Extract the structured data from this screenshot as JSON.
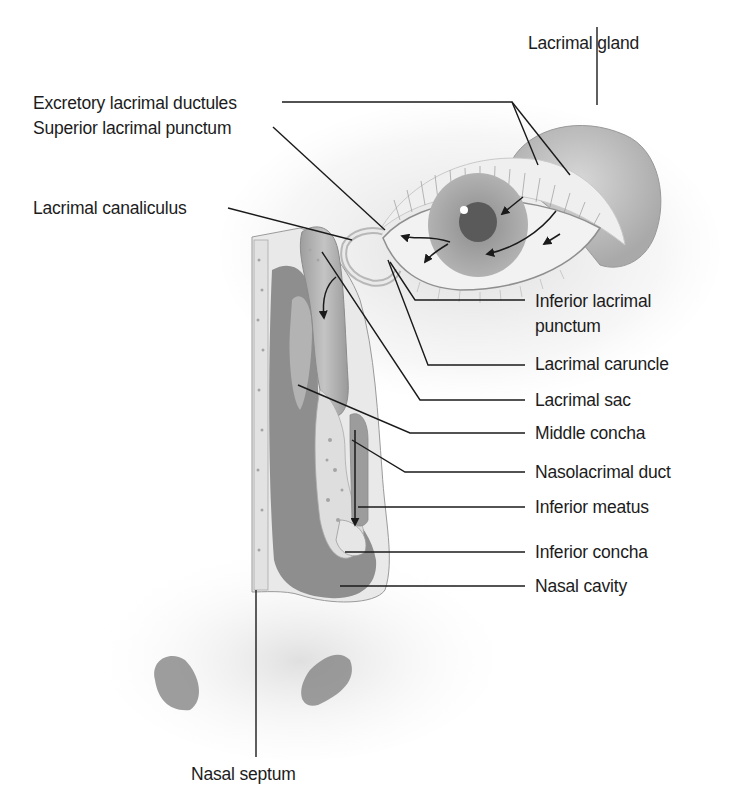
{
  "diagram": {
    "labels": {
      "lacrimal_gland": "Lacrimal gland",
      "excretory_ductules": "Excretory lacrimal ductules",
      "superior_punctum": "Superior lacrimal punctum",
      "lacrimal_canaliculus": "Lacrimal canaliculus",
      "inferior_punctum_line1": "Inferior lacrimal",
      "inferior_punctum_line2": "punctum",
      "lacrimal_caruncle": "Lacrimal caruncle",
      "lacrimal_sac": "Lacrimal sac",
      "middle_concha": "Middle concha",
      "nasolacrimal_duct": "Nasolacrimal duct",
      "inferior_meatus": "Inferior meatus",
      "inferior_concha": "Inferior concha",
      "nasal_cavity": "Nasal cavity",
      "nasal_septum": "Nasal septum"
    },
    "colors": {
      "leader_line": "#1a1a1a",
      "tissue_light": "#e6e6e6",
      "tissue_mid": "#b5b5b5",
      "cavity_dark": "#8a8a8a",
      "iris": "#9a9a9a",
      "pupil": "#555555"
    }
  }
}
